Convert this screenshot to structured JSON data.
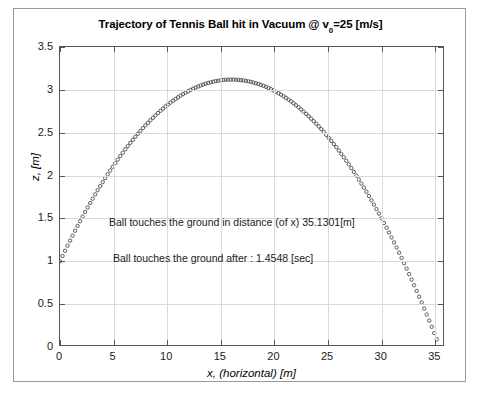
{
  "chart_data": {
    "type": "scatter",
    "title": "Trajectory of Tennis Ball hit in Vacuum @ v",
    "title_subscript": "0",
    "title_suffix": "=25 [m/s]",
    "xlabel": "x, (horizontal) [m]",
    "ylabel": "z, [m]",
    "xlim": [
      0,
      35.9
    ],
    "ylim": [
      0,
      3.5
    ],
    "xticks": [
      0,
      5,
      10,
      15,
      20,
      25,
      30,
      35
    ],
    "xticklabels": [
      "0",
      "5",
      "10",
      "15",
      "20",
      "25",
      "30",
      "35"
    ],
    "yticks": [
      0,
      0.5,
      1,
      1.5,
      2,
      2.5,
      3,
      3.5
    ],
    "yticklabels": [
      "0",
      "0.5",
      "1",
      "1.5",
      "2",
      "2.5",
      "3",
      "3.5"
    ],
    "grid": true,
    "legend": null,
    "marker": "open-circle",
    "marker_color": "#4d4d4d",
    "series_name": "trajectory",
    "initial_speed_m_s": 25,
    "initial_height_m": 1.0,
    "peak_height_m": 3.12,
    "peak_x_m": 16.0,
    "range_m": 35.1301,
    "flight_time_s": 1.4548,
    "annotations": [
      "Ball touches the ground in distance (of x) 35.1301[m]",
      "Ball touches the ground after : 1.4548 [sec]"
    ],
    "x": [
      0,
      0.3513,
      0.7026,
      1.0539,
      1.4052,
      1.7565,
      2.1078,
      2.4591,
      2.8104,
      3.1617,
      3.513,
      3.8643,
      4.2156,
      4.5669,
      4.9182,
      5.2695,
      5.6208,
      5.9721,
      6.3234,
      6.6747,
      7.026,
      7.3773,
      7.7286,
      8.0799,
      8.4312,
      8.7825,
      9.1338,
      9.4851,
      9.8364,
      10.1877,
      10.539,
      10.8903,
      11.2416,
      11.5929,
      11.9442,
      12.2955,
      12.6468,
      12.9981,
      13.3494,
      13.7007,
      14.052,
      14.4033,
      14.7546,
      15.1059,
      15.4572,
      15.8085,
      16.1598,
      16.5111,
      16.8624,
      17.2137,
      17.565,
      17.9163,
      18.2676,
      18.6189,
      18.9702,
      19.3215,
      19.6728,
      20.0241,
      20.3754,
      20.7267,
      21.078,
      21.4293,
      21.7806,
      22.1319,
      22.4832,
      22.8345,
      23.1858,
      23.5371,
      23.8884,
      24.2397,
      24.591,
      24.9423,
      25.2936,
      25.6449,
      25.9962,
      26.3475,
      26.6988,
      27.0501,
      27.4014,
      27.7527,
      28.104,
      28.4553,
      28.8066,
      29.1579,
      29.5092,
      29.8605,
      30.2118,
      30.5631,
      30.9144,
      31.2657,
      31.617,
      31.9683,
      32.3196,
      32.6709,
      33.0222,
      33.3735,
      33.7248,
      34.0761,
      34.4274,
      34.7787,
      35.1301
    ],
    "z": [
      1.0,
      1.0707,
      1.1391,
      1.2052,
      1.2689,
      1.3303,
      1.3894,
      1.4461,
      1.5005,
      1.5526,
      1.6024,
      1.6499,
      1.695,
      1.7378,
      1.7783,
      1.8164,
      1.8523,
      1.8858,
      1.917,
      1.9458,
      1.9724,
      2.0,
      2.0266,
      2.0528,
      2.0787,
      2.1041,
      2.1292,
      2.1539,
      2.1782,
      2.2022,
      2.2258,
      2.249,
      2.2718,
      2.2943,
      2.3163,
      2.338,
      2.3593,
      2.3803,
      2.4008,
      2.421,
      2.4408,
      2.4602,
      2.4792,
      2.4979,
      2.5162,
      2.5341,
      2.5516,
      2.5688,
      2.5855,
      2.6019,
      2.6179,
      2.6335,
      2.6488,
      2.6637,
      2.6782,
      2.6923,
      2.706,
      2.7194,
      2.7324,
      2.745,
      2.7572,
      2.7691,
      2.7806,
      2.7917,
      2.8024,
      2.8128,
      2.8227,
      2.8323,
      2.8416,
      2.8504,
      2.8589,
      2.867,
      2.8747,
      2.882,
      2.889,
      2.8956,
      2.9018,
      2.9076,
      2.9131,
      2.9182,
      2.9229,
      2.9272,
      2.9312,
      2.9348,
      2.938,
      2.9408,
      2.9433,
      2.9454,
      2.9471,
      2.9485,
      2.9494,
      2.95,
      2.9503,
      2.9501,
      2.9496,
      2.9487,
      2.9475,
      2.9459,
      2.9439,
      2.9415,
      2.9388
    ]
  }
}
